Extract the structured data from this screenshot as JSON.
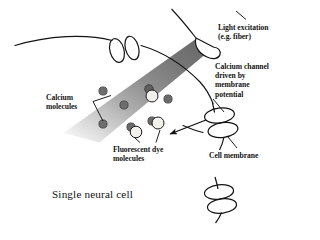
{
  "figure": {
    "caption": "Single neural cell",
    "background_color": "#ffffff",
    "ink_color": "#131313"
  },
  "labels": {
    "light_excitation": "Light excitation\n(e.g. fiber)",
    "calcium_channel": "Calcium channel\ndriven by\nmembrane\npotential",
    "calcium_molecules": "Calcium\nmolecules",
    "fluorescent_dye": "Fluorescent dye\nmolecules",
    "cell_membrane": "Cell membrane",
    "single_neural_cell": "Single neural cell"
  },
  "diagram_elements": {
    "light_cone": {
      "name": "excitation-light-cone",
      "color_near_fiber": "#6f6f6f",
      "color_far": "#e8e8e8",
      "description": "gradient beam widening from fiber tip toward lower left"
    },
    "optical_fiber_tip": {
      "name": "optical-fiber-tip",
      "color": "#ffffff",
      "outline": "#131313"
    },
    "membrane_curve": {
      "name": "cell-membrane-curve",
      "color": "#131313"
    },
    "ion_channels": [
      {
        "name": "calcium-channel-top",
        "x": 124,
        "y": 50
      },
      {
        "name": "calcium-channel-right",
        "x": 219,
        "y": 122
      },
      {
        "name": "calcium-channel-bottom",
        "x": 221,
        "y": 199
      }
    ],
    "calcium_molecules": {
      "name": "calcium-molecule",
      "fill": "#6e6e6e",
      "stroke": "#3a3a3a",
      "radius": 4.1,
      "positions": [
        [
          103,
          91
        ],
        [
          124,
          105
        ],
        [
          103,
          124
        ],
        [
          131,
          127
        ],
        [
          157,
          99
        ],
        [
          152,
          121
        ],
        [
          149,
          89
        ]
      ]
    },
    "dye_molecules": {
      "name": "fluorescent-dye-molecule",
      "fill": "#efeeea",
      "stroke": "#1b1b1b",
      "radius": 5.6,
      "positions": [
        [
          152,
          99
        ],
        [
          158,
          126
        ],
        [
          136,
          132
        ]
      ]
    },
    "influx_arrow": {
      "name": "calcium-influx-arrow",
      "from": [
        204,
        123
      ],
      "to": [
        167,
        135
      ]
    }
  }
}
